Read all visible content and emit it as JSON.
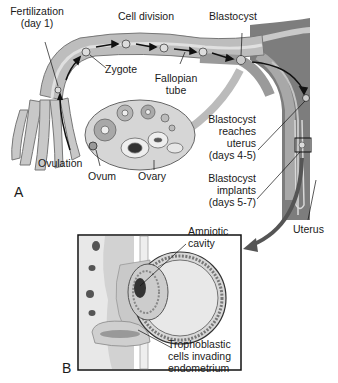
{
  "diagram": {
    "panels": [
      {
        "id": "A",
        "label": "A"
      },
      {
        "id": "B",
        "label": "B"
      }
    ],
    "labels": {
      "fertilization": "Fertilization",
      "fertilization_day": "(day 1)",
      "cell_division": "Cell division",
      "blastocyst": "Blastocyst",
      "zygote": "Zygote",
      "fallopian": "Fallopian",
      "tube": "tube",
      "ovulation": "Ovulation",
      "ovum": "Ovum",
      "ovary": "Ovary",
      "reaches_1": "Blastocyst",
      "reaches_2": "reaches",
      "reaches_3": "uterus",
      "reaches_4": "(days 4-5)",
      "implants_1": "Blastocyst",
      "implants_2": "implants",
      "implants_3": "(days 5-7)",
      "uterus": "Uterus",
      "amniotic_1": "Amniotic",
      "amniotic_2": "cavity",
      "tropho_1": "Trophoblastic",
      "tropho_2": "cells invading",
      "tropho_3": "endometrium"
    },
    "colors": {
      "tube_fill": "#bdbdbd",
      "tube_dark": "#8f8f8f",
      "uterus_fill": "#7d7d7d",
      "ovary_fill": "#d6d6d6",
      "arrow": "#555555",
      "inset_bg": "#e6e6e6"
    }
  }
}
